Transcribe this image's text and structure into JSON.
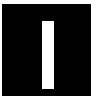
{
  "icon": {
    "name": "pause-or-bar-icon",
    "background_color": "#000000",
    "bar_color": "#ffffff"
  }
}
